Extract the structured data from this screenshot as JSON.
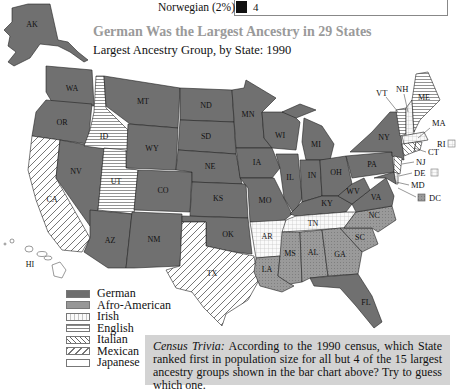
{
  "bar_chart_fragment": {
    "label": "Norwegian (2%)",
    "value": "4",
    "bar_color": "#111111"
  },
  "header": {
    "title": "German Was the Largest Ancestry in 29 States",
    "subtitle": "Largest Ancestry Group, by State:  1990"
  },
  "legend": {
    "items": [
      {
        "label": "German",
        "pattern": "solid-dark",
        "color": "#6e6e6e"
      },
      {
        "label": "Afro-American",
        "pattern": "stipple-medium",
        "color": "#979797"
      },
      {
        "label": "Irish",
        "pattern": "grid",
        "color": "#f2f2f2"
      },
      {
        "label": "English",
        "pattern": "horizontal-lines",
        "color": "#ffffff"
      },
      {
        "label": "Italian",
        "pattern": "backslash-diagonal",
        "color": "#ffffff"
      },
      {
        "label": "Mexican",
        "pattern": "slash-diagonal",
        "color": "#ffffff"
      },
      {
        "label": "Japanese",
        "pattern": "blank",
        "color": "#ffffff"
      }
    ]
  },
  "states": {
    "AK": "German",
    "WA": "German",
    "OR": "German",
    "CA": "Mexican",
    "NV": "German",
    "ID": "English",
    "MT": "German",
    "WY": "German",
    "UT": "English",
    "CO": "German",
    "AZ": "German",
    "NM": "German",
    "ND": "German",
    "SD": "German",
    "NE": "German",
    "KS": "German",
    "OK": "German",
    "TX": "Mexican",
    "MN": "German",
    "IA": "German",
    "MO": "German",
    "AR": "Irish",
    "LA": "Afro-American",
    "WI": "German",
    "IL": "German",
    "MI": "German",
    "IN": "German",
    "OH": "German",
    "KY": "German",
    "TN": "Irish",
    "MS": "Afro-American",
    "AL": "Afro-American",
    "GA": "Afro-American",
    "FL": "German",
    "SC": "Afro-American",
    "NC": "Afro-American",
    "VA": "German",
    "WV": "German",
    "PA": "German",
    "NY": "German",
    "VT": "English",
    "NH": "Irish",
    "ME": "English",
    "MA": "Irish",
    "RI": "Italian",
    "CT": "Italian",
    "NJ": "Italian",
    "DE": "Irish",
    "MD": "German",
    "DC": "Afro-American",
    "HI": "Japanese"
  },
  "state_labels": {
    "AK": "AK",
    "WA": "WA",
    "OR": "OR",
    "CA": "CA",
    "NV": "NV",
    "ID": "ID",
    "MT": "MT",
    "WY": "WY",
    "UT": "UT",
    "CO": "CO",
    "AZ": "AZ",
    "NM": "NM",
    "ND": "ND",
    "SD": "SD",
    "NE": "NE",
    "KS": "KS",
    "OK": "OK",
    "TX": "TX",
    "MN": "MN",
    "IA": "IA",
    "MO": "MO",
    "AR": "AR",
    "LA": "LA",
    "WI": "WI",
    "IL": "IL",
    "MI": "MI",
    "IN": "IN",
    "OH": "OH",
    "KY": "KY",
    "TN": "TN",
    "MS": "MS",
    "AL": "AL",
    "GA": "GA",
    "FL": "FL",
    "SC": "SC",
    "NC": "NC",
    "VA": "VA",
    "WV": "WV",
    "PA": "PA",
    "NY": "NY",
    "VT": "VT",
    "NH": "NH",
    "ME": "ME",
    "MA": "MA",
    "RI": "RI",
    "CT": "CT",
    "NJ": "NJ",
    "DE": "DE",
    "MD": "MD",
    "DC": "DC",
    "HI": "HI"
  },
  "trivia": {
    "lead": "Census Trivia:",
    "text": " According to the 1990 census, which State ranked first in population size for all but 4 of the 15 largest ancestry groups shown in the bar chart above? Try to guess which one."
  }
}
